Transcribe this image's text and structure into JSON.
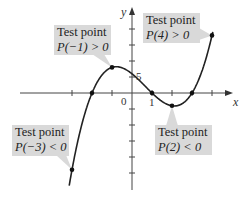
{
  "chart_data": {
    "type": "line",
    "title": "",
    "function": "P(x) = (x+2)(x-1)(x-3)",
    "xlabel": "x",
    "ylabel": "y",
    "xlim": [
      -3.3,
      4.6
    ],
    "ylim": [
      -28,
      25
    ],
    "x_ticks": [
      -3,
      -2,
      -1,
      0,
      1,
      2,
      3,
      4
    ],
    "y_tick_step": 5,
    "tick_labels": {
      "origin": "0",
      "x_one": "1",
      "y_five": "5"
    },
    "grid": false,
    "roots": [
      -2,
      1,
      3
    ],
    "test_points": [
      {
        "x": -3,
        "y": -24,
        "label_line1": "Test point",
        "label_line2": "P(−3) < 0"
      },
      {
        "x": -1,
        "y": 8,
        "label_line1": "Test point",
        "label_line2": "P(−1) > 0"
      },
      {
        "x": 2,
        "y": -4,
        "label_line1": "Test point",
        "label_line2": "P(2) < 0"
      },
      {
        "x": 4,
        "y": 18,
        "label_line1": "Test point",
        "label_line2": "P(4) > 0"
      }
    ],
    "curve_color": "#222222",
    "callout_color": "#d9d9d9"
  }
}
